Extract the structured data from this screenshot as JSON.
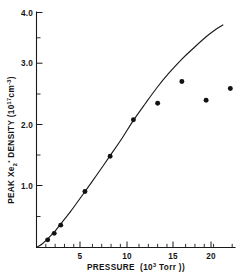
{
  "figure": {
    "background_color": "#ffffff",
    "ink_color": "#141414"
  },
  "chart_data": {
    "type": "scatter",
    "title": "",
    "subtitle": "",
    "xlabel": "PRESSURE (10^3 Torr)",
    "xlabel_parts": {
      "name": "PRESSURE",
      "open": "(10",
      "exponent": "3",
      "unit": " Torr )"
    },
    "ylabel": "PEAK Xe2* DENSITY (10^17 cm^-3)",
    "ylabel_parts": {
      "name": "PEAK Xe",
      "species_sub": "2",
      "species_star": "*",
      "density": " DENSITY (10",
      "exponent": "17",
      "unit": "cm",
      "unit_exponent": "-3",
      "close": ")"
    },
    "xlim": [
      0,
      21.3
    ],
    "ylim": [
      0,
      4.0
    ],
    "grid": false,
    "legend": null,
    "legend_position": "none",
    "xticks": [
      5,
      10,
      15,
      20
    ],
    "xtick_labels": [
      "5",
      "10",
      "15",
      "20"
    ],
    "xticks_minor": [
      1,
      2,
      3,
      4,
      6,
      7,
      8,
      9,
      11,
      12,
      13,
      14,
      16,
      17,
      18,
      19,
      21
    ],
    "yticks": [
      1.0,
      2.0,
      3.0,
      4.0
    ],
    "ytick_labels": [
      "1.0",
      "2.0",
      "3.0",
      "4.0"
    ],
    "yticks_minor": [
      0.5,
      1.5,
      2.5,
      3.5
    ],
    "series": [
      {
        "name": "measured",
        "type": "scatter",
        "marker": "filled-circle",
        "marker_color": "#121212",
        "marker_size": 4.2,
        "x": [
          1.2,
          1.9,
          2.6,
          5.2,
          7.9,
          10.4,
          13.0,
          15.6,
          18.2,
          20.8
        ],
        "y": [
          0.13,
          0.24,
          0.38,
          0.95,
          1.55,
          2.17,
          2.45,
          2.82,
          2.5,
          2.7
        ]
      },
      {
        "name": "model",
        "type": "line",
        "line_color": "#1b1b1b",
        "x": [
          0.0,
          0.6,
          1.2,
          1.9,
          2.6,
          3.6,
          5.2,
          6.5,
          7.9,
          9.2,
          10.4,
          11.7,
          13.0,
          14.2,
          15.6,
          16.8,
          18.2,
          19.3,
          20.0
        ],
        "y": [
          0.0,
          0.06,
          0.15,
          0.26,
          0.4,
          0.6,
          0.95,
          1.24,
          1.56,
          1.86,
          2.16,
          2.45,
          2.73,
          2.96,
          3.2,
          3.38,
          3.58,
          3.71,
          3.78
        ]
      }
    ]
  }
}
